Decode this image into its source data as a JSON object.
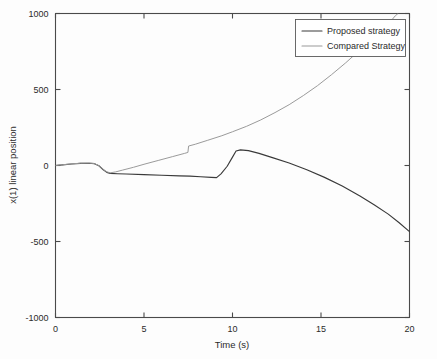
{
  "chart_data": {
    "type": "line",
    "title": "",
    "xlabel": "Time (s)",
    "ylabel": "x(1) linear position",
    "xlim": [
      0,
      20
    ],
    "ylim": [
      -1000,
      1000
    ],
    "xticks": [
      0,
      5,
      10,
      15,
      20
    ],
    "xtick_labels": [
      "0",
      "5",
      "10",
      "15",
      "20"
    ],
    "yticks": [
      -1000,
      -500,
      0,
      500,
      1000
    ],
    "ytick_labels": [
      "-1000",
      "-500",
      "0",
      "500",
      "1000"
    ],
    "grid": false,
    "legend_position": "upper right",
    "series": [
      {
        "name": "Proposed strategy",
        "color": "#3a3a3a",
        "points": [
          [
            0.0,
            0
          ],
          [
            0.4,
            4
          ],
          [
            0.9,
            10
          ],
          [
            1.4,
            14
          ],
          [
            1.9,
            15
          ],
          [
            2.2,
            12
          ],
          [
            2.45,
            -2
          ],
          [
            2.7,
            -28
          ],
          [
            2.9,
            -45
          ],
          [
            3.1,
            -52
          ],
          [
            3.5,
            -54
          ],
          [
            4.0,
            -56
          ],
          [
            5.0,
            -60
          ],
          [
            6.0,
            -64
          ],
          [
            7.0,
            -68
          ],
          [
            7.6,
            -70
          ],
          [
            8.2,
            -74
          ],
          [
            8.8,
            -78
          ],
          [
            9.1,
            -80
          ],
          [
            9.35,
            -55
          ],
          [
            9.7,
            -5
          ],
          [
            10.0,
            55
          ],
          [
            10.2,
            95
          ],
          [
            10.45,
            103
          ],
          [
            10.9,
            98
          ],
          [
            11.5,
            80
          ],
          [
            12.3,
            50
          ],
          [
            13.2,
            16
          ],
          [
            14.2,
            -28
          ],
          [
            15.2,
            -78
          ],
          [
            16.2,
            -135
          ],
          [
            17.2,
            -200
          ],
          [
            18.0,
            -258
          ],
          [
            18.8,
            -320
          ],
          [
            19.4,
            -375
          ],
          [
            20.0,
            -435
          ]
        ]
      },
      {
        "name": "Compared Strategy",
        "color": "#9a9a9a",
        "points": [
          [
            0.0,
            0
          ],
          [
            0.4,
            5
          ],
          [
            0.9,
            11
          ],
          [
            1.4,
            15
          ],
          [
            1.9,
            16
          ],
          [
            2.2,
            13
          ],
          [
            2.45,
            -1
          ],
          [
            2.7,
            -26
          ],
          [
            2.9,
            -42
          ],
          [
            3.1,
            -48
          ],
          [
            3.4,
            -42
          ],
          [
            3.8,
            -30
          ],
          [
            4.4,
            -12
          ],
          [
            5.0,
            8
          ],
          [
            5.8,
            33
          ],
          [
            6.6,
            58
          ],
          [
            7.3,
            80
          ],
          [
            7.48,
            86
          ],
          [
            7.52,
            128
          ],
          [
            7.9,
            140
          ],
          [
            8.6,
            166
          ],
          [
            9.4,
            196
          ],
          [
            10.0,
            222
          ],
          [
            10.8,
            258
          ],
          [
            11.6,
            300
          ],
          [
            12.4,
            348
          ],
          [
            13.2,
            400
          ],
          [
            14.0,
            460
          ],
          [
            14.8,
            525
          ],
          [
            15.6,
            598
          ],
          [
            16.4,
            676
          ],
          [
            17.2,
            760
          ],
          [
            18.0,
            846
          ],
          [
            18.6,
            912
          ],
          [
            19.0,
            958
          ],
          [
            19.2,
            985
          ],
          [
            19.35,
            1000
          ]
        ]
      }
    ]
  },
  "legend": {
    "entries": [
      {
        "label": "Proposed strategy"
      },
      {
        "label": "Compared Strategy"
      }
    ]
  },
  "axes": {
    "x_title": "Time (s)",
    "y_title": "x(1) linear position"
  }
}
